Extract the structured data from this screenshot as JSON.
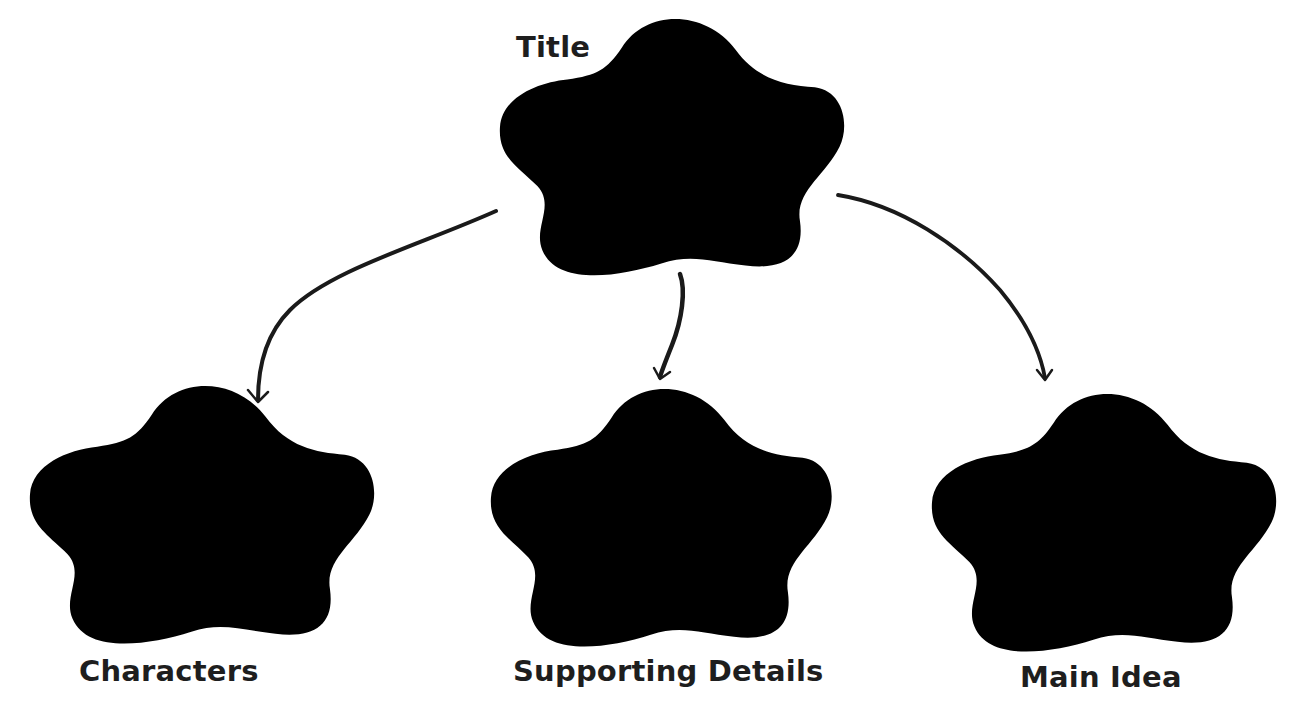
{
  "diagram": {
    "type": "graphic-organizer",
    "colors": {
      "outline": "#8a8a8a",
      "arrow": "#1a1a1a",
      "text": "#1e1e1e",
      "background": "#ffffff"
    },
    "nodes": [
      {
        "id": "title",
        "label": "Title",
        "shape": "flower"
      },
      {
        "id": "characters",
        "label": "Characters",
        "shape": "flower"
      },
      {
        "id": "supporting-details",
        "label": "Supporting Details",
        "shape": "flower"
      },
      {
        "id": "main-idea",
        "label": "Main Idea",
        "shape": "flower"
      }
    ],
    "edges": [
      {
        "from": "title",
        "to": "characters"
      },
      {
        "from": "title",
        "to": "supporting-details"
      },
      {
        "from": "title",
        "to": "main-idea"
      }
    ]
  }
}
